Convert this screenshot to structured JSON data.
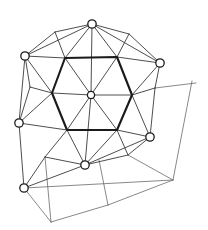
{
  "figure": {
    "background_color": "#ffffff",
    "width": 208,
    "height": 230,
    "stroke_color_thin": "#3a3a3a",
    "stroke_color_faint": "#6a6a6a",
    "stroke_color_bold": "#1a1a1a",
    "node_fill": "#ffffff",
    "node_stroke": "#1c1c1c",
    "node_radius": 4.2,
    "center_node_radius": 3.6
  },
  "nodes": [
    {
      "id": "n-top",
      "label": "top node",
      "x": 92,
      "y": 24
    },
    {
      "id": "n-upper-left",
      "label": "upper left node",
      "x": 25,
      "y": 56
    },
    {
      "id": "n-upper-right",
      "label": "upper right node",
      "x": 160,
      "y": 63
    },
    {
      "id": "n-center",
      "label": "center node",
      "x": 91,
      "y": 95
    },
    {
      "id": "n-left",
      "label": "left node",
      "x": 19,
      "y": 123
    },
    {
      "id": "n-lower-right",
      "label": "lower right node",
      "x": 150,
      "y": 137
    },
    {
      "id": "n-bottom",
      "label": "bottom node",
      "x": 85,
      "y": 165
    },
    {
      "id": "n-bottom-left",
      "label": "bottom left node",
      "x": 24,
      "y": 188
    }
  ],
  "hexagon": {
    "label": "inner bold hexagon",
    "points": "65,58 117,57 132,95 117,130 67,130 52,93",
    "stroke_weight": "bold"
  },
  "spokes": [
    {
      "label": "center to hexagon vertex top-left",
      "x1": 91,
      "y1": 95,
      "x2": 65,
      "y2": 58
    },
    {
      "label": "center to hexagon vertex top-right",
      "x1": 91,
      "y1": 95,
      "x2": 117,
      "y2": 57
    },
    {
      "label": "center to hexagon vertex right",
      "x1": 91,
      "y1": 95,
      "x2": 132,
      "y2": 95
    },
    {
      "label": "center to hexagon vertex bottom-right",
      "x1": 91,
      "y1": 95,
      "x2": 117,
      "y2": 130
    },
    {
      "label": "center to hexagon vertex bottom-left",
      "x1": 91,
      "y1": 95,
      "x2": 67,
      "y2": 130
    },
    {
      "label": "center to hexagon vertex left",
      "x1": 91,
      "y1": 95,
      "x2": 52,
      "y2": 93
    }
  ],
  "radial_edges": [
    {
      "label": "top node to hexagon top-left",
      "x1": 92,
      "y1": 24,
      "x2": 65,
      "y2": 58
    },
    {
      "label": "top node to hexagon top-right",
      "x1": 92,
      "y1": 24,
      "x2": 117,
      "y2": 57
    },
    {
      "label": "top node vertical to center",
      "x1": 92,
      "y1": 24,
      "x2": 91,
      "y2": 95
    },
    {
      "label": "upper-left node to hexagon top-left",
      "x1": 25,
      "y1": 56,
      "x2": 65,
      "y2": 58
    },
    {
      "label": "upper-left node to top node",
      "x1": 25,
      "y1": 56,
      "x2": 92,
      "y2": 24
    },
    {
      "label": "upper-left node to hexagon left",
      "x1": 25,
      "y1": 56,
      "x2": 52,
      "y2": 93
    },
    {
      "label": "upper-right node to hexagon top-right",
      "x1": 160,
      "y1": 63,
      "x2": 117,
      "y2": 57
    },
    {
      "label": "upper-right node to top node",
      "x1": 160,
      "y1": 63,
      "x2": 92,
      "y2": 24
    },
    {
      "label": "upper-right node to hexagon right",
      "x1": 160,
      "y1": 63,
      "x2": 132,
      "y2": 95
    },
    {
      "label": "left node to hexagon left",
      "x1": 19,
      "y1": 123,
      "x2": 52,
      "y2": 93
    },
    {
      "label": "left node up to upper-left node",
      "x1": 19,
      "y1": 123,
      "x2": 25,
      "y2": 56
    },
    {
      "label": "left node to hexagon bottom-left",
      "x1": 19,
      "y1": 123,
      "x2": 67,
      "y2": 130
    },
    {
      "label": "left node down to bottom-left node",
      "x1": 19,
      "y1": 123,
      "x2": 24,
      "y2": 188
    },
    {
      "label": "lower-right node to hexagon right",
      "x1": 150,
      "y1": 137,
      "x2": 132,
      "y2": 95
    },
    {
      "label": "lower-right node to hexagon bottom-right",
      "x1": 150,
      "y1": 137,
      "x2": 117,
      "y2": 130
    },
    {
      "label": "lower-right node up to upper-right",
      "x1": 150,
      "y1": 137,
      "x2": 155,
      "y2": 88
    },
    {
      "label": "bottom node to hexagon bottom-left",
      "x1": 85,
      "y1": 165,
      "x2": 67,
      "y2": 130
    },
    {
      "label": "bottom node to hexagon bottom-right",
      "x1": 85,
      "y1": 165,
      "x2": 117,
      "y2": 130
    },
    {
      "label": "bottom node vertical to center",
      "x1": 85,
      "y1": 165,
      "x2": 91,
      "y2": 95
    },
    {
      "label": "bottom node to bottom-left node",
      "x1": 85,
      "y1": 165,
      "x2": 24,
      "y2": 188
    },
    {
      "label": "bottom node to lower-right node",
      "x1": 85,
      "y1": 165,
      "x2": 150,
      "y2": 137
    }
  ],
  "cell_edges": [
    {
      "label": "upper-left cell divider",
      "x1": 55,
      "y1": 32,
      "x2": 65,
      "y2": 58
    },
    {
      "label": "upper-right cell divider",
      "x1": 129,
      "y1": 34,
      "x2": 117,
      "y2": 57
    },
    {
      "label": "left cell divider",
      "x1": 30,
      "y1": 87,
      "x2": 52,
      "y2": 93
    },
    {
      "label": "right cell divider",
      "x1": 155,
      "y1": 88,
      "x2": 132,
      "y2": 95
    },
    {
      "label": "lower-left cell divider",
      "x1": 45,
      "y1": 157,
      "x2": 67,
      "y2": 130
    },
    {
      "label": "lower-right cell divider",
      "x1": 128,
      "y1": 155,
      "x2": 117,
      "y2": 130
    },
    {
      "label": "upper-left outer arc",
      "x1": 55,
      "y1": 32,
      "x2": 25,
      "y2": 56
    },
    {
      "label": "upper-left outer arc b",
      "x1": 55,
      "y1": 32,
      "x2": 92,
      "y2": 24
    },
    {
      "label": "upper-right outer arc",
      "x1": 129,
      "y1": 34,
      "x2": 160,
      "y2": 63
    },
    {
      "label": "upper-right outer arc b",
      "x1": 129,
      "y1": 34,
      "x2": 92,
      "y2": 24
    },
    {
      "label": "left outer arc",
      "x1": 30,
      "y1": 87,
      "x2": 25,
      "y2": 56
    },
    {
      "label": "left outer arc b",
      "x1": 30,
      "y1": 87,
      "x2": 19,
      "y2": 123
    },
    {
      "label": "right outer arc",
      "x1": 155,
      "y1": 88,
      "x2": 160,
      "y2": 63
    },
    {
      "label": "lower-left outer arc",
      "x1": 45,
      "y1": 157,
      "x2": 24,
      "y2": 188
    },
    {
      "label": "lower-left outer arc b",
      "x1": 45,
      "y1": 157,
      "x2": 85,
      "y2": 165
    },
    {
      "label": "lower-right outer arc",
      "x1": 128,
      "y1": 155,
      "x2": 150,
      "y2": 137
    },
    {
      "label": "lower-right outer arc b",
      "x1": 128,
      "y1": 155,
      "x2": 85,
      "y2": 165
    }
  ],
  "outer_extension_edges": [
    {
      "label": "right horizontal extension from cell divider",
      "x1": 155,
      "y1": 88,
      "x2": 196,
      "y2": 83
    },
    {
      "label": "right vertical extension down",
      "x1": 192,
      "y1": 81,
      "x2": 173,
      "y2": 180
    },
    {
      "label": "lower-right boundary to bottom-right",
      "x1": 128,
      "y1": 155,
      "x2": 173,
      "y2": 180
    },
    {
      "label": "bottom long diagonal boundary",
      "x1": 24,
      "y1": 188,
      "x2": 173,
      "y2": 180
    },
    {
      "label": "bottom-left vertical drop",
      "x1": 45,
      "y1": 157,
      "x2": 51,
      "y2": 222
    },
    {
      "label": "bottom-left long edge",
      "x1": 51,
      "y1": 222,
      "x2": 24,
      "y2": 188
    },
    {
      "label": "bottom mid vertical drop",
      "x1": 99,
      "y1": 160,
      "x2": 108,
      "y2": 205
    },
    {
      "label": "bottom-most boundary right leg",
      "x1": 108,
      "y1": 205,
      "x2": 173,
      "y2": 180
    },
    {
      "label": "bottom-most boundary left leg",
      "x1": 108,
      "y1": 205,
      "x2": 51,
      "y2": 222
    }
  ]
}
